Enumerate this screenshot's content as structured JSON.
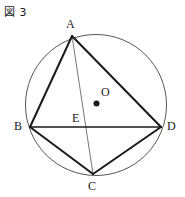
{
  "figure": {
    "caption": "図 3",
    "caption_icon": "figure-kanji-zu",
    "background_color": "#ffffff",
    "ink_color": "#1a1a1a",
    "circle_color": "#555555",
    "thin_line_color": "#777777"
  },
  "labels": {
    "A": "A",
    "B": "B",
    "C": "C",
    "D": "D",
    "E": "E",
    "O": "O"
  },
  "geometry": {
    "circle": {
      "cx": 96,
      "cy": 105,
      "r": 70.5
    },
    "center_dot": {
      "cx": 96.5,
      "cy": 103.5,
      "r": 3
    },
    "points": {
      "A": {
        "x": 72,
        "y": 36
      },
      "B": {
        "x": 30,
        "y": 127
      },
      "C": {
        "x": 93,
        "y": 174
      },
      "D": {
        "x": 161,
        "y": 127
      },
      "E": {
        "x": 86,
        "y": 127
      },
      "O": {
        "x": 96.5,
        "y": 103.5
      }
    },
    "label_positions": {
      "A": {
        "x": 66,
        "y": 18
      },
      "B": {
        "x": 14,
        "y": 120
      },
      "C": {
        "x": 88,
        "y": 180
      },
      "D": {
        "x": 167,
        "y": 120
      },
      "E": {
        "x": 72,
        "y": 112
      },
      "O": {
        "x": 101,
        "y": 86
      }
    },
    "thick_segments": [
      {
        "name": "AB",
        "from": "A",
        "to": "B"
      },
      {
        "name": "BC",
        "from": "B",
        "to": "C"
      },
      {
        "name": "CD",
        "from": "C",
        "to": "D"
      },
      {
        "name": "DA",
        "from": "D",
        "to": "A"
      },
      {
        "name": "BD",
        "from": "B",
        "to": "D"
      }
    ],
    "thin_segments": [
      {
        "name": "AC",
        "from": "A",
        "to": "C"
      }
    ]
  }
}
